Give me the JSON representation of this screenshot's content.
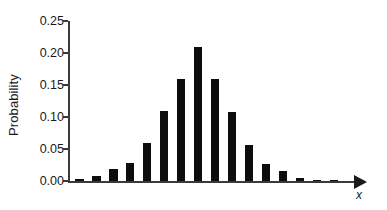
{
  "chart_data": {
    "type": "bar",
    "title": "",
    "xlabel": "x",
    "ylabel": "Probability",
    "categories": [
      "0",
      "1",
      "2",
      "3",
      "4",
      "5",
      "6",
      "7",
      "8",
      "9",
      "10",
      "11",
      "12",
      "13",
      "14",
      "15"
    ],
    "values": [
      0.003,
      0.008,
      0.018,
      0.028,
      0.059,
      0.109,
      0.159,
      0.209,
      0.159,
      0.108,
      0.057,
      0.026,
      0.015,
      0.005,
      0.002,
      0.001
    ],
    "ylim": [
      0.0,
      0.25
    ],
    "yticks": [
      0.0,
      0.05,
      0.1,
      0.15,
      0.2,
      0.25
    ],
    "ytick_labels": [
      "0.00",
      "0.05",
      "0.10",
      "0.15",
      "0.20",
      "0.25"
    ],
    "xtick_labels": [],
    "grid": false,
    "legend": false,
    "legend_position": "none",
    "bar_color": "#0d0d0d",
    "axis_color": "#3a3a3a",
    "background_color": "#ffffff",
    "x_axis_arrow": true
  }
}
